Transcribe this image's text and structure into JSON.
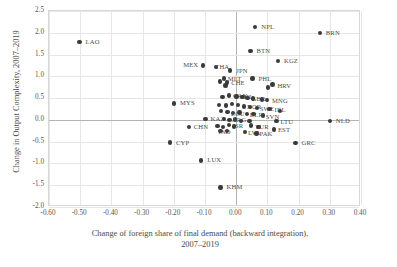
{
  "chart_data": {
    "type": "scatter",
    "title": "",
    "xlabel": "Change of foreign share of final demand (backward integration), 2007–2019",
    "xlabel_line1": "Change of foreign share of final demand (backward integration),",
    "xlabel_line2": "2007–2019",
    "ylabel": "Change in Output Complexity, 2007–2019",
    "xlim": [
      -0.6,
      0.4
    ],
    "ylim": [
      -2.0,
      2.5
    ],
    "xticks": [
      "-0.60",
      "-0.50",
      "-0.40",
      "-0.30",
      "-0.20",
      "-0.10",
      "0.00",
      "0.10",
      "0.20",
      "0.30",
      "0.40"
    ],
    "xtick_values": [
      -0.6,
      -0.5,
      -0.4,
      -0.3,
      -0.2,
      -0.1,
      0.0,
      0.1,
      0.2,
      0.3,
      0.4
    ],
    "yticks": [
      "2.5",
      "2.0",
      "1.5",
      "1.0",
      "0.5",
      "0.0",
      "-0.5",
      "-1.0",
      "-1.5",
      "-2.0"
    ],
    "ytick_values": [
      2.5,
      2.0,
      1.5,
      1.0,
      0.5,
      0.0,
      -0.5,
      -1.0,
      -1.5,
      -2.0
    ],
    "grid": true,
    "legend": "none",
    "marker_color": "#3a3a3a",
    "points": [
      {
        "label": "LAO",
        "x": -0.502,
        "y": 1.79
      },
      {
        "label": "NPL",
        "x": 0.061,
        "y": 2.13
      },
      {
        "label": "BRN",
        "x": 0.268,
        "y": 1.99
      },
      {
        "label": "BTN",
        "x": 0.046,
        "y": 1.58
      },
      {
        "label": "KGZ",
        "x": 0.134,
        "y": 1.35
      },
      {
        "label": "MEX",
        "x": -0.106,
        "y": 1.25
      },
      {
        "label": "THA",
        "x": -0.064,
        "y": 1.21
      },
      {
        "label": "JPN",
        "x": -0.019,
        "y": 1.13
      },
      {
        "label": "MLT",
        "x": -0.04,
        "y": 0.95
      },
      {
        "label": "PHL",
        "x": 0.052,
        "y": 0.95
      },
      {
        "label": "CHE",
        "x": -0.029,
        "y": 0.86
      },
      {
        "label": "",
        "x": -0.051,
        "y": 0.88
      },
      {
        "label": "",
        "x": -0.034,
        "y": 0.79
      },
      {
        "label": "HRV",
        "x": 0.116,
        "y": 0.81
      },
      {
        "label": "",
        "x": 0.102,
        "y": 0.74
      },
      {
        "label": "CAN",
        "x": -0.023,
        "y": 0.56
      },
      {
        "label": "",
        "x": -0.044,
        "y": 0.52
      },
      {
        "label": "CHL",
        "x": 0.001,
        "y": 0.54
      },
      {
        "label": "",
        "x": 0.02,
        "y": 0.52
      },
      {
        "label": "GBR",
        "x": 0.036,
        "y": 0.5
      },
      {
        "label": "",
        "x": 0.053,
        "y": 0.49
      },
      {
        "label": "MNG",
        "x": 0.099,
        "y": 0.46
      },
      {
        "label": "",
        "x": 0.082,
        "y": 0.47
      },
      {
        "label": "MYS",
        "x": -0.199,
        "y": 0.38
      },
      {
        "label": "",
        "x": -0.056,
        "y": 0.34
      },
      {
        "label": "",
        "x": -0.033,
        "y": 0.33
      },
      {
        "label": "",
        "x": -0.014,
        "y": 0.36
      },
      {
        "label": "",
        "x": 0.006,
        "y": 0.34
      },
      {
        "label": "NOR",
        "x": 0.025,
        "y": 0.31
      },
      {
        "label": "",
        "x": 0.044,
        "y": 0.3
      },
      {
        "label": "SWE",
        "x": 0.066,
        "y": 0.27
      },
      {
        "label": "IRL",
        "x": 0.107,
        "y": 0.25
      },
      {
        "label": "",
        "x": 0.141,
        "y": 0.2
      },
      {
        "label": "",
        "x": -0.049,
        "y": 0.2
      },
      {
        "label": "",
        "x": -0.028,
        "y": 0.18
      },
      {
        "label": "ECU",
        "x": -0.01,
        "y": 0.16
      },
      {
        "label": "",
        "x": 0.01,
        "y": 0.17
      },
      {
        "label": "BLR",
        "x": 0.034,
        "y": 0.14
      },
      {
        "label": "",
        "x": 0.056,
        "y": 0.13
      },
      {
        "label": "SVN",
        "x": 0.085,
        "y": 0.1
      },
      {
        "label": "KAZ",
        "x": -0.098,
        "y": 0.02
      },
      {
        "label": "",
        "x": -0.04,
        "y": 0.02
      },
      {
        "label": "",
        "x": -0.021,
        "y": 0.0
      },
      {
        "label": "ARG",
        "x": -0.004,
        "y": 0.01
      },
      {
        "label": "",
        "x": 0.016,
        "y": -0.02
      },
      {
        "label": "",
        "x": 0.042,
        "y": -0.03
      },
      {
        "label": "LTU",
        "x": 0.129,
        "y": -0.03
      },
      {
        "label": "NLD",
        "x": 0.3,
        "y": -0.02
      },
      {
        "label": "CHN",
        "x": -0.152,
        "y": -0.17
      },
      {
        "label": "",
        "x": -0.06,
        "y": -0.14
      },
      {
        "label": "",
        "x": -0.043,
        "y": -0.16
      },
      {
        "label": "ISR",
        "x": -0.024,
        "y": -0.12
      },
      {
        "label": "",
        "x": -0.008,
        "y": -0.15
      },
      {
        "label": "TUR",
        "x": 0.048,
        "y": -0.13
      },
      {
        "label": "",
        "x": 0.072,
        "y": -0.16
      },
      {
        "label": "EST",
        "x": 0.121,
        "y": -0.22
      },
      {
        "label": "IND",
        "x": -0.05,
        "y": -0.26
      },
      {
        "label": "",
        "x": -0.03,
        "y": -0.25
      },
      {
        "label": "LVA",
        "x": 0.028,
        "y": -0.28
      },
      {
        "label": "PAK",
        "x": 0.065,
        "y": -0.31
      },
      {
        "label": "CYP",
        "x": -0.212,
        "y": -0.52
      },
      {
        "label": "GRC",
        "x": 0.19,
        "y": -0.53
      },
      {
        "label": "LUX",
        "x": -0.112,
        "y": -0.93
      },
      {
        "label": "KHM",
        "x": -0.05,
        "y": -1.55
      }
    ],
    "label_offsets": {
      "LAO": [
        6,
        -4
      ],
      "NPL": [
        6,
        -4
      ],
      "BRN": [
        6,
        -4
      ],
      "BTN": [
        6,
        -4
      ],
      "KGZ": [
        6,
        -4
      ],
      "MEX": [
        -20,
        -4
      ],
      "THA": [
        -1,
        -4
      ],
      "JPN": [
        6,
        -4
      ],
      "MLT": [
        4,
        -4
      ],
      "PHL": [
        6,
        -4
      ],
      "CHE": [
        4,
        -3
      ],
      "HRV": [
        5,
        -3
      ],
      "CAN": [
        4,
        -3
      ],
      "CHL": [
        3,
        -3
      ],
      "GBR": [
        4,
        -3
      ],
      "MNG": [
        5,
        -3
      ],
      "MYS": [
        6,
        -4
      ],
      "NOR": [
        3,
        -3
      ],
      "SWE": [
        3,
        -3
      ],
      "IRL": [
        5,
        -3
      ],
      "ECU": [
        -2,
        -3
      ],
      "BLR": [
        3,
        -3
      ],
      "SVN": [
        3,
        -3
      ],
      "KAZ": [
        5,
        -4
      ],
      "ARG": [
        -3,
        -3
      ],
      "LTU": [
        4,
        -3
      ],
      "NLD": [
        6,
        -4
      ],
      "CHN": [
        5,
        -4
      ],
      "ISR": [
        4,
        -3
      ],
      "TUR": [
        4,
        -3
      ],
      "EST": [
        4,
        -3
      ],
      "IND": [
        -2,
        -3
      ],
      "LVA": [
        3,
        -3
      ],
      "PAK": [
        3,
        -3
      ],
      "CYP": [
        6,
        -4
      ],
      "GRC": [
        6,
        -4
      ],
      "LUX": [
        6,
        -4
      ],
      "KHM": [
        6,
        -4
      ]
    }
  }
}
